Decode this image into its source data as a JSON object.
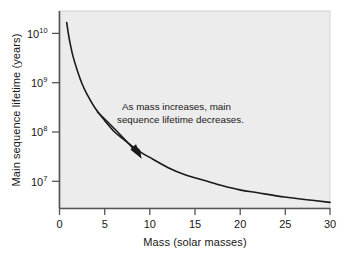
{
  "chart_data": {
    "type": "line",
    "title": "",
    "subtitle": "",
    "xlabel": "Mass (solar masses)",
    "ylabel": "Main sequence lifetime (years)",
    "xlim": [
      0,
      30
    ],
    "ylim": [
      3000000,
      30000000000
    ],
    "yscale": "log",
    "xscale": "linear",
    "grid": false,
    "legend": null,
    "xticks": [
      0,
      5,
      10,
      15,
      20,
      25,
      30
    ],
    "xtick_labels": [
      "0",
      "5",
      "10",
      "15",
      "20",
      "25",
      "30"
    ],
    "yticks": [
      10000000,
      100000000,
      1000000000,
      10000000000
    ],
    "ytick_labels": [
      "10⁷",
      "10⁸",
      "10⁹",
      "10¹⁰"
    ],
    "ytick_bases": [
      "10",
      "10",
      "10",
      "10"
    ],
    "ytick_exponents": [
      "7",
      "8",
      "9",
      "10"
    ],
    "series": [
      {
        "name": "Main sequence lifetime",
        "x": [
          0.8,
          1.0,
          1.2,
          1.5,
          2.0,
          2.5,
          3.0,
          4.0,
          5.0,
          6.0,
          7.0,
          8.0,
          9.0,
          10.0,
          12.0,
          14.0,
          16.0,
          18.0,
          20.0,
          22.0,
          25.0,
          28.0,
          30.0
        ],
        "y": [
          17500000000.0,
          10000000000.0,
          6300000000.0,
          3600000000.0,
          1800000000.0,
          1000000000.0,
          640000000.0,
          310000000.0,
          180000000.0,
          110000000.0,
          77000000.0,
          55000000.0,
          41000000.0,
          32000000.0,
          20000000.0,
          14000000.0,
          11000000.0,
          8600000.0,
          7000000.0,
          6100000.0,
          5000000.0,
          4300000.0,
          3900000.0
        ],
        "color": "#1a1a1a",
        "linewidth": 1.6
      }
    ],
    "annotations": [
      {
        "name": "trend-annotation",
        "text_lines": [
          "As mass increases, main",
          "sequence lifetime decreases."
        ],
        "arrow": {
          "from": [
            97,
            112
          ],
          "to": [
            141,
            158
          ],
          "style": "curved"
        }
      }
    ],
    "colors": {
      "plot_background": "#ececec",
      "page_background": "#ffffff",
      "curve": "#1a1a1a",
      "axis": "#555555",
      "text": "#171717"
    }
  }
}
